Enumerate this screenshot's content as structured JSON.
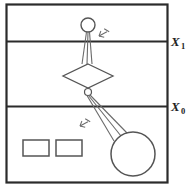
{
  "figure": {
    "title": "",
    "background_color": "#ffffff",
    "frame_color": "#2b2b2b",
    "shape_color": "#555555",
    "line_color": "#6a6a6a",
    "label_color": "#222222",
    "frame": {
      "x": 6,
      "y": 4,
      "width": 161,
      "height": 178
    },
    "reference_lines": [
      {
        "name": "upper-reference-line",
        "label_main": "X",
        "label_sub": "1",
        "y": 41,
        "label_x": 172,
        "label_y": 46
      },
      {
        "name": "lower-reference-line",
        "label_main": "X",
        "label_sub": "0",
        "y": 106,
        "label_x": 172,
        "label_y": 111
      }
    ],
    "shapes": {
      "upper_node_circle": {
        "cx": 88,
        "cy": 25,
        "r": 7
      },
      "diamond": {
        "cx": 88,
        "cy": 76,
        "half_width": 25,
        "half_height": 12
      },
      "pivot_circle": {
        "cx": 88,
        "cy": 92,
        "r": 3.5
      },
      "large_circle": {
        "cx": 133,
        "cy": 154,
        "r": 22
      },
      "rectangles": [
        {
          "name": "rectangle-left",
          "x": 23,
          "y": 140,
          "width": 26,
          "height": 16
        },
        {
          "name": "rectangle-right",
          "x": 56,
          "y": 140,
          "width": 26,
          "height": 16
        }
      ]
    },
    "connector_groups": [
      {
        "name": "upper-connector-fan",
        "from": {
          "x": 88,
          "y": 32
        },
        "to_points": [
          {
            "x": 82,
            "y": 64
          },
          {
            "x": 87,
            "y": 64
          },
          {
            "x": 92,
            "y": 64
          }
        ]
      },
      {
        "name": "lower-connector-fan",
        "from": {
          "x": 88,
          "y": 95
        },
        "to_points": [
          {
            "x": 114,
            "y": 140
          },
          {
            "x": 120,
            "y": 136
          },
          {
            "x": 126,
            "y": 133
          }
        ]
      }
    ],
    "hatch_annotations": [
      {
        "name": "upper-hatch-annotation",
        "x": 98,
        "y": 36,
        "rotation": -28
      },
      {
        "name": "lower-hatch-annotation",
        "x": 83,
        "y": 124,
        "rotation": -28
      }
    ]
  }
}
